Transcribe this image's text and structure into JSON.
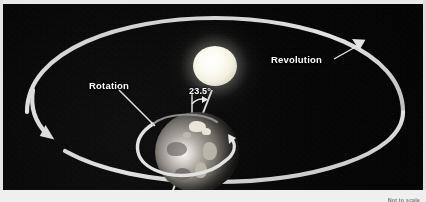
{
  "diagram": {
    "title_visible": false,
    "background_color": "#050505",
    "stroke_color": "#d8d8d8",
    "labels": {
      "revolution": "Revolution",
      "rotation": "Rotation",
      "axial_tilt": "23.5°",
      "footnote": "Not to scale"
    },
    "objects": {
      "sun_name": "sun",
      "earth_name": "earth",
      "orbit_name": "orbit-ellipse",
      "axis_name": "earth-axis",
      "vertical_reference_name": "vertical-reference-line",
      "rotation_ring_name": "rotation-ring"
    },
    "colors": {
      "sun": "#fcfbf2",
      "earth_light": "#d6d2cb",
      "earth_dark": "#262524",
      "line": "#d8d8d8",
      "label_text": "#ffffff",
      "footnote_text": "#7c7c7c",
      "panel_border": "#e9e9e9"
    },
    "values": {
      "axial_tilt_degrees": 23.5,
      "orbit_direction": "counterclockwise",
      "rotation_direction": "west-to-east"
    }
  }
}
